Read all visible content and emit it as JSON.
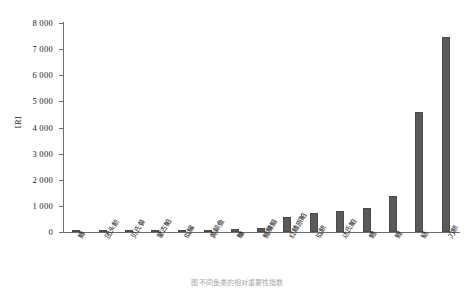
{
  "chart_data": {
    "type": "bar",
    "title": "",
    "xlabel": "",
    "ylabel": "IRI",
    "ylim": [
      0,
      8000
    ],
    "ytick_labels": [
      "8 000",
      "7 000",
      "6 000",
      "5 000",
      "4 000",
      "3 000",
      "2 000",
      "1 000",
      "0"
    ],
    "ytick_values": [
      8000,
      7000,
      6000,
      5000,
      4000,
      3000,
      2000,
      1000,
      0
    ],
    "grid": false,
    "legend": null,
    "bar_color": "#5a5a5a",
    "categories": [
      "鲫",
      "团头鲂",
      "贝氏餐",
      "蒙古鲌",
      "似鳊",
      "黄颡鱼",
      "鳙",
      "鳎鳙鲴",
      "红鳍原鲌",
      "似鲚",
      "达氏鲌",
      "鳢",
      "鲤",
      "鲢",
      "刀鲚"
    ],
    "values": [
      20,
      25,
      30,
      35,
      60,
      95,
      120,
      150,
      560,
      720,
      820,
      930,
      1390,
      4600,
      7480
    ]
  },
  "caption": "图 不同鱼类的相对重要性指数"
}
